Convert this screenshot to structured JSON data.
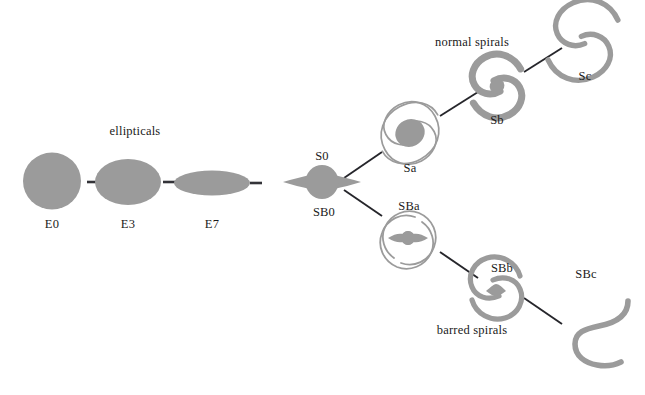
{
  "figure": {
    "title_visible": false,
    "background_color": "#ffffff",
    "galaxy_fill": "#9a9a9a",
    "galaxy_fill_light": "#a6a6a6",
    "galaxy_outline": "#8e8e8e",
    "connector_color": "#26262b",
    "label_color": "#1a1a1a"
  },
  "group_labels": {
    "ellipticals": "ellipticals",
    "normal_spirals": "normal spirals",
    "barred_spirals": "barred spirals"
  },
  "nodes": {
    "e0": {
      "label": "E0",
      "cx": 52,
      "cy": 181,
      "label_x": 52,
      "label_y": 228
    },
    "e3": {
      "label": "E3",
      "cx": 128,
      "cy": 182,
      "label_x": 128,
      "label_y": 228
    },
    "e7": {
      "label": "E7",
      "cx": 212,
      "cy": 183,
      "label_x": 212,
      "label_y": 228
    },
    "s0": {
      "label": "S0",
      "cx": 322,
      "cy": 182,
      "label_x": 322,
      "label_y": 160
    },
    "sb0": {
      "label": "SB0",
      "cx": 322,
      "cy": 182,
      "label_x": 324,
      "label_y": 216
    },
    "sa": {
      "label": "Sa",
      "cx": 410,
      "cy": 133,
      "label_x": 410,
      "label_y": 172
    },
    "sb": {
      "label": "Sb",
      "cx": 497,
      "cy": 86,
      "label_x": 497,
      "label_y": 124
    },
    "sc": {
      "label": "Sc",
      "cx": 583,
      "cy": 40,
      "label_x": 585,
      "label_y": 80
    },
    "sba": {
      "label": "SBa",
      "cx": 408,
      "cy": 240,
      "label_x": 409,
      "label_y": 210
    },
    "sbb": {
      "label": "SBb",
      "cx": 496,
      "cy": 288,
      "label_x": 502,
      "label_y": 272
    },
    "sbc": {
      "label": "SBc",
      "cx": 585,
      "cy": 332,
      "label_x": 586,
      "label_y": 278
    }
  },
  "group_label_positions": {
    "ellipticals": {
      "x": 135,
      "y": 135
    },
    "normal_spirals": {
      "x": 472,
      "y": 46
    },
    "barred_spirals": {
      "x": 472,
      "y": 334
    }
  },
  "sequence": {
    "elliptical_chain": [
      "E0",
      "E3",
      "E7",
      "S0/SB0"
    ],
    "normal_branch": [
      "S0",
      "Sa",
      "Sb",
      "Sc"
    ],
    "barred_branch": [
      "SB0",
      "SBa",
      "SBb",
      "SBc"
    ]
  }
}
